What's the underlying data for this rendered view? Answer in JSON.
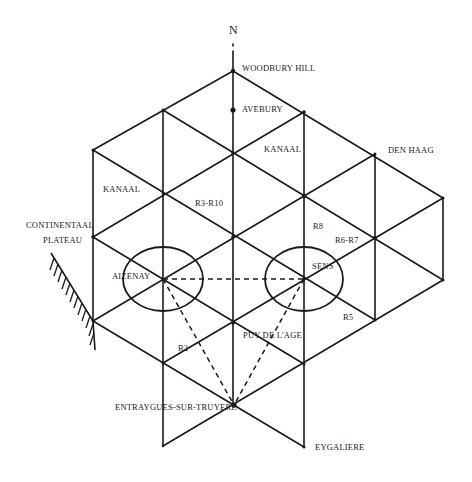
{
  "diagram": {
    "north_label": "N",
    "colors": {
      "ink": "#1a1a1a",
      "background": "#ffffff"
    },
    "places": {
      "woodbury_hill": "WOODBURY HILL",
      "avebury": "AVEBURY",
      "kanaal_right": "KANAAL",
      "den_haag": "DEN HAAG",
      "kanaal_left": "KANAAL",
      "r3_r10": "R3-R10",
      "continentaal": "CONTINENTAAL",
      "plateau": "PLATEAU",
      "r8": "R8",
      "r6_r7": "R6-R7",
      "aizenay": "AIZENAY",
      "sens": "SENS",
      "r5": "R5",
      "puy_de_lage": "PUY DE L'AGE",
      "r2": "R2",
      "entraygues": "ENTRAYGUES-SUR-TRUYERE",
      "eygaliere": "EYGALIERE"
    },
    "zones": [
      {
        "name": "Aizenay",
        "cx": 163,
        "cy": 279,
        "rx": 40,
        "ry": 32
      },
      {
        "name": "Sens",
        "cx": 304,
        "cy": 279,
        "rx": 39,
        "ry": 32
      }
    ],
    "dashed_links": [
      [
        "Aizenay",
        "Sens"
      ],
      [
        "Aizenay",
        "Entraygues-sur-Truyere"
      ],
      [
        "Sens",
        "Entraygues-sur-Truyere"
      ]
    ]
  }
}
